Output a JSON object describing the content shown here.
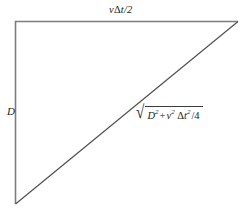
{
  "figure": {
    "type": "geometry-diagram",
    "background_color": "#ffffff",
    "stroke_color": "#6e6e6e",
    "hypotenuse_color": "#4a4a4a",
    "text_color": "#222222",
    "vertices": {
      "top_left": [
        15,
        21
      ],
      "top_right": [
        238,
        21
      ],
      "bottom_left": [
        15,
        204
      ]
    },
    "sides": [
      {
        "name": "top-horizontal-side",
        "from": [
          15,
          21
        ],
        "to": [
          238,
          21
        ],
        "label": "v Δt/2"
      },
      {
        "name": "left-vertical-side",
        "from": [
          15,
          21
        ],
        "to": [
          15,
          204
        ],
        "label": "D"
      },
      {
        "name": "hypotenuse",
        "from": [
          15,
          204
        ],
        "to": [
          238,
          21
        ],
        "label": "√(D² + v² Δt² /4)"
      }
    ]
  },
  "labels": {
    "top": {
      "v": "v",
      "delta": "Δ",
      "t_over_2": "t/2"
    },
    "left": {
      "text": "D"
    },
    "hypotenuse": {
      "radical": "√",
      "d": "D",
      "d_exp": "2",
      "plus": "+",
      "v": "v",
      "v_exp": "2",
      "delta": "Δ",
      "t": "t",
      "t_exp": "2",
      "divided": "/4"
    }
  }
}
